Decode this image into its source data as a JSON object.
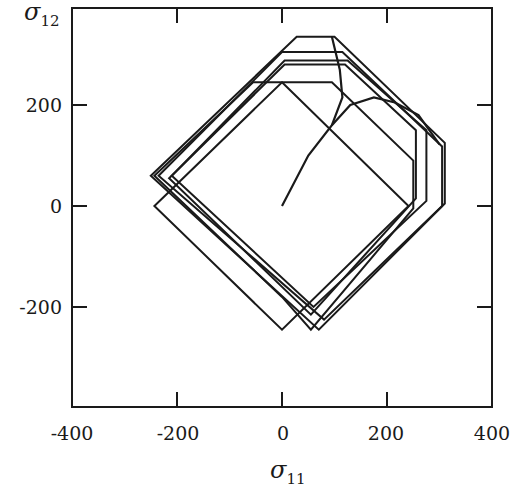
{
  "chart_data": {
    "type": "line",
    "title": "",
    "xlabel": "σ11",
    "ylabel": "σ12",
    "xlabel_main": "σ",
    "xlabel_sub": "11",
    "ylabel_main": "σ",
    "ylabel_sub": "12",
    "xlim": [
      -400,
      400
    ],
    "ylim": [
      -400,
      400
    ],
    "xticks": [
      -400,
      -200,
      0,
      200,
      400
    ],
    "yticks": [
      -200,
      0,
      200
    ],
    "xtick_labels": [
      "-400",
      "-200",
      "0",
      "200",
      "400"
    ],
    "ytick_labels": [
      "-200",
      "0",
      "200"
    ],
    "grid": false,
    "legend": null,
    "color": "#1a1a1a",
    "series": [
      {
        "name": "yield-surface-initial",
        "closed": true,
        "points": [
          [
            0,
            245
          ],
          [
            241,
            0
          ],
          [
            0,
            -245
          ],
          [
            -243,
            0
          ]
        ]
      },
      {
        "name": "yield-surface-shifted-1",
        "closed": true,
        "points": [
          [
            0,
            245
          ],
          [
            -55,
            245
          ],
          [
            -243,
            60
          ],
          [
            0,
            -180
          ],
          [
            55,
            -245
          ],
          [
            250,
            -5
          ],
          [
            250,
            90
          ],
          [
            95,
            245
          ]
        ]
      },
      {
        "name": "yield-surface-2",
        "closed": true,
        "points": [
          [
            5,
            280
          ],
          [
            120,
            280
          ],
          [
            255,
            150
          ],
          [
            255,
            15
          ],
          [
            55,
            -215
          ],
          [
            -215,
            55
          ],
          [
            5,
            280
          ]
        ]
      },
      {
        "name": "yield-surface-3",
        "closed": true,
        "points": [
          [
            5,
            288
          ],
          [
            125,
            288
          ],
          [
            275,
            150
          ],
          [
            275,
            10
          ],
          [
            60,
            -200
          ],
          [
            -210,
            60
          ],
          [
            5,
            288
          ]
        ]
      },
      {
        "name": "yield-surface-4",
        "closed": true,
        "points": [
          [
            0,
            305
          ],
          [
            115,
            305
          ],
          [
            305,
            118
          ],
          [
            305,
            0
          ],
          [
            80,
            -225
          ],
          [
            -235,
            60
          ],
          [
            0,
            305
          ]
        ]
      },
      {
        "name": "yield-surface-5",
        "closed": true,
        "points": [
          [
            28,
            335
          ],
          [
            100,
            335
          ],
          [
            310,
            125
          ],
          [
            310,
            5
          ],
          [
            70,
            -245
          ],
          [
            -250,
            60
          ],
          [
            28,
            335
          ]
        ]
      },
      {
        "name": "stress-path-branch-up",
        "closed": false,
        "points": [
          [
            0,
            0
          ],
          [
            50,
            100
          ],
          [
            95,
            160
          ],
          [
            115,
            215
          ],
          [
            110,
            270
          ],
          [
            95,
            335
          ]
        ]
      },
      {
        "name": "stress-path-branch-right",
        "closed": false,
        "points": [
          [
            95,
            160
          ],
          [
            130,
            200
          ],
          [
            175,
            215
          ],
          [
            215,
            205
          ],
          [
            260,
            180
          ],
          [
            300,
            122
          ]
        ]
      }
    ]
  }
}
